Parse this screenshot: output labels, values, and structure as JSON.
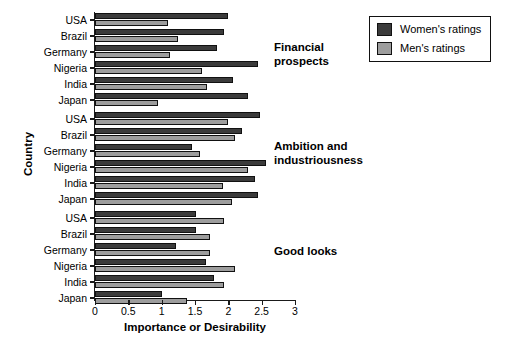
{
  "chart_data": {
    "type": "bar",
    "orientation": "horizontal",
    "title": "",
    "xlabel": "Importance or Desirability",
    "ylabel": "Country",
    "xlim": [
      0,
      3
    ],
    "xticks": [
      "0",
      "0.5",
      "1",
      "1.5",
      "2",
      "2.5",
      "3"
    ],
    "xtick_values": [
      0,
      0.5,
      1,
      1.5,
      2,
      2.5,
      3
    ],
    "grid": false,
    "legend_position": "top-right",
    "categories": [
      "USA",
      "Brazil",
      "Germany",
      "Nigeria",
      "India",
      "Japan"
    ],
    "series": [
      {
        "name": "Women's ratings",
        "color": "#3b3b3b"
      },
      {
        "name": "Men's ratings",
        "color": "#9d9d9d"
      }
    ],
    "groups": [
      {
        "label": "Financial\nprospects",
        "categories": [
          "USA",
          "Brazil",
          "Germany",
          "Nigeria",
          "India",
          "Japan"
        ],
        "women": [
          2.0,
          1.93,
          1.83,
          2.45,
          2.07,
          2.3
        ],
        "men": [
          1.1,
          1.25,
          1.13,
          1.6,
          1.68,
          0.95
        ]
      },
      {
        "label": "Ambition and\nindustriousness",
        "categories": [
          "USA",
          "Brazil",
          "Germany",
          "Nigeria",
          "India",
          "Japan"
        ],
        "women": [
          2.48,
          2.2,
          1.45,
          2.57,
          2.4,
          2.45
        ],
        "men": [
          2.0,
          2.1,
          1.58,
          2.3,
          1.92,
          2.05
        ]
      },
      {
        "label": "Good looks",
        "categories": [
          "USA",
          "Brazil",
          "Germany",
          "Nigeria",
          "India",
          "Japan"
        ],
        "women": [
          1.52,
          1.52,
          1.22,
          1.67,
          1.78,
          1.0
        ],
        "men": [
          1.93,
          1.72,
          1.73,
          2.1,
          1.93,
          1.38
        ]
      }
    ]
  },
  "legend": {
    "items": [
      {
        "label": "Women's ratings",
        "color": "#3b3b3b"
      },
      {
        "label": "Men's ratings",
        "color": "#9d9d9d"
      }
    ]
  },
  "axis": {
    "x_title": "Importance or Desirability",
    "y_title": "Country"
  }
}
